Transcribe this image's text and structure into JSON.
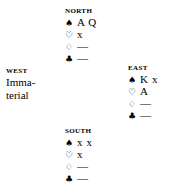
{
  "diagram": {
    "type": "bridge-deal",
    "background": "#ffffff",
    "ink": "#000000"
  },
  "suits": {
    "spade": {
      "name": "spade-suit-symbol",
      "glyph": "♠",
      "filled": true
    },
    "heart": {
      "name": "heart-suit-symbol",
      "glyph": "♡",
      "filled": false
    },
    "diamond": {
      "name": "diamond-suit-symbol",
      "glyph": "♢",
      "filled": false
    },
    "club": {
      "name": "club-suit-symbol",
      "glyph": "♣",
      "filled": true
    }
  },
  "hands": {
    "north": {
      "seat": "NORTH",
      "spades": "A Q",
      "hearts": "x",
      "diamonds": "—",
      "clubs": "—"
    },
    "east": {
      "seat": "EAST",
      "spades": "K x",
      "hearts": "A",
      "diamonds": "—",
      "clubs": "—"
    },
    "south": {
      "seat": "SOUTH",
      "spades": "x x",
      "hearts": "x",
      "diamonds": "—",
      "clubs": "—"
    },
    "west": {
      "seat": "WEST",
      "text": "Imma-\nterial"
    }
  }
}
